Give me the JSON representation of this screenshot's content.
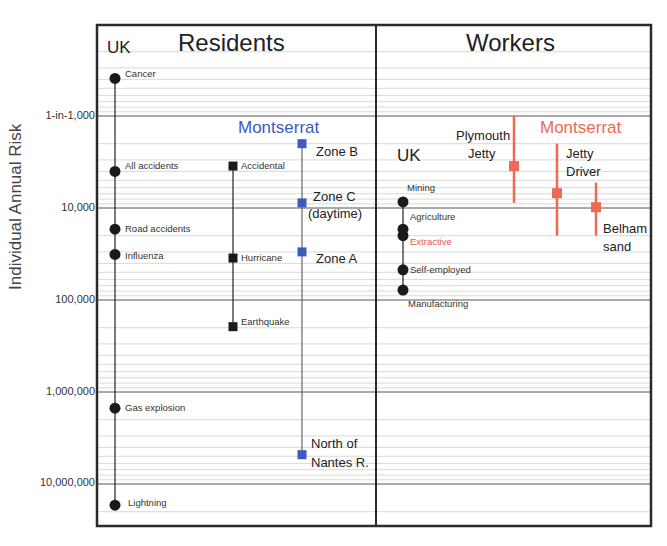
{
  "chart_data": {
    "type": "scatter",
    "title": "",
    "ylabel": "Individual Annual Risk",
    "xlabel": "",
    "yscale": "log",
    "y_units": "1 in N per year",
    "ylim": [
      200,
      30000000
    ],
    "grid": true,
    "y_ticks": [
      {
        "value": 1000,
        "label": "1-in-1,000"
      },
      {
        "value": 10000,
        "label": "10,000"
      },
      {
        "value": 100000,
        "label": "100,000"
      },
      {
        "value": 1000000,
        "label": "1,000,000"
      },
      {
        "value": 10000000,
        "label": "10,000,000"
      }
    ],
    "panels": [
      {
        "title": "Residents",
        "groups": [
          {
            "name": "UK",
            "marker": "circle",
            "color": "#1a1a1a",
            "points": [
              {
                "label": "Cancer",
                "value": 390
              },
              {
                "label": "All accidents",
                "value": 4000
              },
              {
                "label": "Road accidents",
                "value": 17000
              },
              {
                "label": "Influenza",
                "value": 32000
              },
              {
                "label": "Gas explosion",
                "value": 1500000
              },
              {
                "label": "Lightning",
                "value": 17000000
              }
            ]
          },
          {
            "name": "Montserrat (hazard)",
            "marker": "square",
            "color": "#1a1a1a",
            "points": [
              {
                "label": "Accidental",
                "value": 3500
              },
              {
                "label": "Hurricane",
                "value": 35000
              },
              {
                "label": "Earthquake",
                "value": 195000
              }
            ]
          },
          {
            "name": "Montserrat",
            "marker": "square",
            "color": "#3b5bbf",
            "points": [
              {
                "label": "Zone B",
                "value": 2000
              },
              {
                "label": "Zone C (daytime)",
                "value": 8800
              },
              {
                "label": "Zone A",
                "value": 30000
              },
              {
                "label": "North of Nantes R.",
                "value": 4800000
              }
            ]
          }
        ]
      },
      {
        "title": "Workers",
        "groups": [
          {
            "name": "UK",
            "marker": "circle",
            "color": "#1a1a1a",
            "points": [
              {
                "label": "Mining",
                "value": 8600
              },
              {
                "label": "Agriculture",
                "value": 17000
              },
              {
                "label": "Extractive",
                "value": 20000,
                "label_color": "#e8594a"
              },
              {
                "label": "Self-employed",
                "value": 47000
              },
              {
                "label": "Manufacturing",
                "value": 78000
              }
            ]
          },
          {
            "name": "Montserrat",
            "marker": "square",
            "color": "#ef6a55",
            "error_bars": true,
            "points": [
              {
                "label": "Plymouth Jetty",
                "value": 3500,
                "range": [
                  1000,
                  8800
                ]
              },
              {
                "label": "Jetty Driver",
                "value": 6900,
                "range": [
                  2000,
                  20000
                ]
              },
              {
                "label": "Belham sand",
                "value": 9800,
                "range": [
                  5300,
                  20000
                ]
              }
            ]
          }
        ]
      }
    ]
  },
  "labels": {
    "ylabel": "Individual Annual Risk",
    "ticks": [
      "1-in-1,000",
      "10,000",
      "100,000",
      "1,000,000",
      "10,000,000"
    ],
    "residents": {
      "title": "Residents",
      "uk": "UK",
      "montserrat": "Montserrat",
      "uk_points": [
        "Cancer",
        "All accidents",
        "Road accidents",
        "Influenza",
        "Gas explosion",
        "Lightning"
      ],
      "hazard_points": [
        "Accidental",
        "Hurricane",
        "Earthquake"
      ],
      "zone_b": "Zone B",
      "zone_c1": "Zone C",
      "zone_c2": "(daytime)",
      "zone_a": "Zone A",
      "nantes1": "North of",
      "nantes2": "Nantes R."
    },
    "workers": {
      "title": "Workers",
      "uk": "UK",
      "montserrat": "Montserrat",
      "uk_points": [
        "Mining",
        "Agriculture",
        "Extractive",
        "Self-employed",
        "Manufacturing"
      ],
      "plymouth1": "Plymouth",
      "plymouth2": "Jetty",
      "driver1": "Jetty",
      "driver2": "Driver",
      "belham1": "Belham",
      "belham2": "sand"
    }
  },
  "colors": {
    "frame": "#2a2a2a",
    "grid_major": "#555555",
    "grid_minor": "#c8c8c8",
    "uk": "#1a1a1a",
    "montserrat_residents": "#3b5bbf",
    "montserrat_workers": "#ef6a55",
    "extractive_label": "#e8594a"
  }
}
